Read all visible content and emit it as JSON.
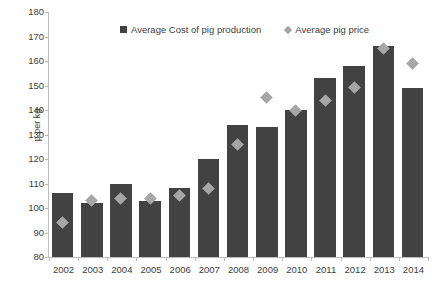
{
  "chart_data": {
    "type": "bar",
    "title": "",
    "xlabel": "",
    "ylabel": "p per kg",
    "ylim": [
      80,
      180
    ],
    "ytick_step": 10,
    "yticks": [
      180,
      170,
      160,
      150,
      140,
      130,
      120,
      110,
      100,
      90,
      80
    ],
    "grid": false,
    "legend_position": "top-center",
    "categories": [
      "2002",
      "2003",
      "2004",
      "2005",
      "2006",
      "2007",
      "2008",
      "2009",
      "2010",
      "2011",
      "2012",
      "2013",
      "2014"
    ],
    "series": [
      {
        "name": "Average Cost of pig production",
        "marker": "square",
        "color": "#424242",
        "values": [
          106,
          102,
          110,
          103,
          108,
          120,
          134,
          133,
          140,
          153,
          158,
          166,
          149
        ]
      },
      {
        "name": "Average pig price",
        "marker": "diamond",
        "color": "#a6a6a6",
        "values": [
          94,
          103,
          104,
          104,
          105,
          108,
          126,
          145,
          140,
          144,
          149,
          165,
          159
        ]
      }
    ]
  },
  "legend": {
    "items": [
      {
        "label": "Average Cost of pig production"
      },
      {
        "label": "Average pig price"
      }
    ]
  }
}
